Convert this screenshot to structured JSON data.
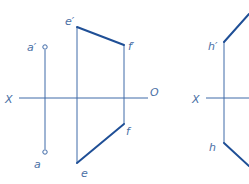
{
  "colors": {
    "thin_line": "#3f6aa8",
    "thick_line": "#1f4f96",
    "label": "#4a6fa5",
    "background": "#ffffff"
  },
  "figure_left": {
    "axis": {
      "label_x": "X",
      "label_o": "O"
    },
    "point_a": {
      "upper_label": "a′",
      "lower_label": "a"
    },
    "line_ef": {
      "e_upper": "e′",
      "f_upper": "f′",
      "e_lower": "e",
      "f_lower": "f"
    }
  },
  "figure_right": {
    "axis": {
      "label_x": "X"
    },
    "line_h": {
      "upper_label": "h′",
      "lower_label": "h"
    }
  }
}
